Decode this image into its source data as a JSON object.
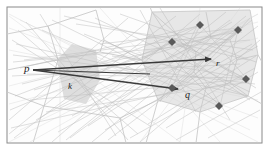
{
  "figure": {
    "caption_present": false,
    "frame": {
      "border_color": "#8a8a8a",
      "background_color": "#ffffff",
      "inner_background_color": "#fdfdfd"
    },
    "palette": {
      "mesh_line": "#cfcfcf",
      "mesh_line_faint": "#dddddd",
      "region_light": "#e2e2e2",
      "region_mid": "#d2d2d2",
      "region_dark": "#6f6f6f",
      "arrow": "#3a3a3a",
      "marker": "#5a5a5a",
      "label": "#1a1a1a"
    },
    "labels": [
      {
        "id": "p",
        "text": "p",
        "x": 26,
        "y": 68,
        "size": 11
      },
      {
        "id": "k",
        "text": "k",
        "x": 70,
        "y": 86,
        "size": 9
      },
      {
        "id": "q",
        "text": "q",
        "x": 187,
        "y": 95,
        "size": 10
      },
      {
        "id": "r",
        "text": "r",
        "x": 217,
        "y": 63,
        "size": 9
      }
    ],
    "arrows": [
      {
        "id": "p-to-r",
        "from": [
          33,
          70
        ],
        "to": [
          212,
          59
        ],
        "label": "r"
      },
      {
        "id": "p-to-q",
        "from": [
          33,
          70
        ],
        "to": [
          180,
          90
        ],
        "label": "q"
      },
      {
        "id": "p-to-k",
        "from": [
          33,
          70
        ],
        "to": [
          150,
          73
        ],
        "label": "k"
      }
    ],
    "regions": [
      {
        "id": "region-left-k",
        "fill": "#e0e0e0",
        "opacity": 0.85,
        "points": "57,60 72,44 96,50 100,80 86,104 64,99"
      },
      {
        "id": "region-right-outer",
        "fill": "#e6e6e6",
        "opacity": 0.9,
        "points": "152,12 250,10 258,55 248,96 200,112 158,100 142,60"
      },
      {
        "id": "region-right-dark",
        "fill": "#6f6f6f",
        "opacity": 1,
        "points": "196,52 211,38 230,40 237,60 230,83 206,88 194,72"
      }
    ],
    "markers": [
      {
        "id": "marker-1",
        "x": 200,
        "y": 25
      },
      {
        "id": "marker-2",
        "x": 238,
        "y": 30
      },
      {
        "id": "marker-3",
        "x": 172,
        "y": 42
      },
      {
        "id": "marker-4",
        "x": 246,
        "y": 79
      },
      {
        "id": "marker-5",
        "x": 172,
        "y": 88
      },
      {
        "id": "marker-6",
        "x": 219,
        "y": 106
      },
      {
        "id": "marker-7",
        "x": 181,
        "y": 90
      }
    ]
  }
}
